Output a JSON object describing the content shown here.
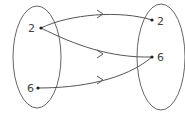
{
  "diagram": {
    "type": "mapping-diagram",
    "domain_set": {
      "elements": [
        {
          "label": "2",
          "x": 41,
          "y": 28
        },
        {
          "label": "6",
          "x": 38,
          "y": 88
        }
      ]
    },
    "range_set": {
      "elements": [
        {
          "label": "2",
          "x": 152,
          "y": 20
        },
        {
          "label": "6",
          "x": 152,
          "y": 57
        }
      ]
    },
    "mappings": [
      {
        "from": "2",
        "to": "2"
      },
      {
        "from": "2",
        "to": "6"
      },
      {
        "from": "6",
        "to": "6"
      }
    ],
    "colors": {
      "stroke": "#555555",
      "text": "#444444"
    }
  }
}
